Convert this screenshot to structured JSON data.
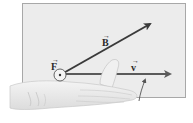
{
  "diagram": {
    "type": "right-hand-rule",
    "panel": {
      "fill": "#ececec",
      "border": "#9a9a9a"
    },
    "vectors": [
      {
        "id": "F",
        "label": "F",
        "vector_mark": "→",
        "direction": "out-of-page",
        "symbol": "dot-in-circle"
      },
      {
        "id": "B",
        "label": "B",
        "vector_mark": "→",
        "direction": "up-right",
        "color": "#3a3a3a"
      },
      {
        "id": "v",
        "label": "v",
        "vector_mark": "→",
        "direction": "right",
        "color": "#5a5a5a"
      }
    ],
    "hand": {
      "description": "right hand, palm flat, fingers along v, thumb pointing out of page"
    }
  }
}
